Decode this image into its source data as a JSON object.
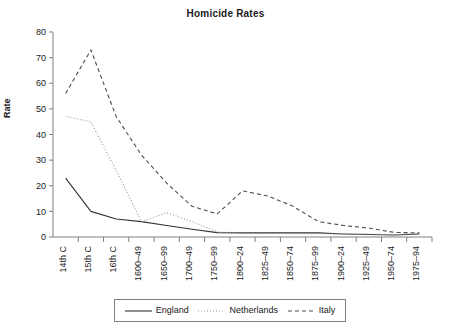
{
  "chart_data": {
    "type": "line",
    "title": "Homicide Rates",
    "xlabel": "",
    "ylabel": "Rate",
    "ylim": [
      0,
      80
    ],
    "ytick_values": [
      0,
      10,
      20,
      30,
      40,
      50,
      60,
      70,
      80
    ],
    "ytick_labels": [
      "0",
      "10",
      "20",
      "30",
      "40",
      "50",
      "60",
      "70",
      "80"
    ],
    "grid": false,
    "legend_position": "bottom",
    "categories": [
      "14th C",
      "15th C",
      "16th C",
      "1600–49",
      "1650–99",
      "1700–49",
      "1750–99",
      "1800–24",
      "1825–49",
      "1850–74",
      "1875–99",
      "1900–24",
      "1925–49",
      "1950–74",
      "1975–94"
    ],
    "series": [
      {
        "name": "England",
        "style": "solid",
        "color": "#333333",
        "values": [
          23,
          10,
          7,
          6,
          4.5,
          3,
          1.7,
          1.6,
          1.6,
          1.6,
          1.6,
          1.2,
          1,
          0.8,
          1.2
        ]
      },
      {
        "name": "Netherlands",
        "style": "dotted",
        "color": "#999999",
        "values": [
          47,
          45,
          26,
          6,
          9.5,
          6,
          2,
          1.5,
          1.4,
          1.3,
          1.3,
          1.2,
          1.1,
          0.9,
          1.4
        ]
      },
      {
        "name": "Italy",
        "style": "dashed",
        "color": "#4d4d4d",
        "values": [
          56,
          73,
          47,
          32,
          21,
          12,
          9,
          18,
          16,
          12,
          6,
          4.5,
          3.5,
          1.8,
          1.6
        ]
      }
    ]
  },
  "legend": {
    "items": [
      {
        "label": "England"
      },
      {
        "label": "Netherlands"
      },
      {
        "label": "Italy"
      }
    ]
  },
  "axes": {
    "y_label": "Rate"
  }
}
